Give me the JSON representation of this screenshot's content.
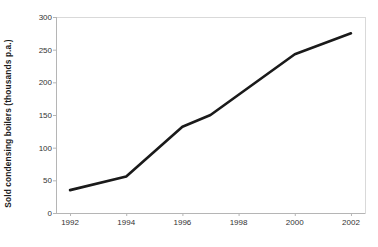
{
  "chart_data": {
    "type": "line",
    "title": "",
    "xlabel": "",
    "ylabel": "Sold condensing boilers (thousands p.a.)",
    "x": [
      1992,
      1994,
      1996,
      1997,
      2000,
      2002
    ],
    "values": [
      35,
      56,
      132,
      150,
      243,
      275
    ],
    "series": [
      {
        "name": "Sold condensing boilers",
        "values": [
          35,
          56,
          132,
          150,
          243,
          275
        ]
      }
    ],
    "xlim": [
      1991.5,
      2002.5
    ],
    "ylim": [
      0,
      300
    ],
    "ytick_labels": [
      "0",
      "50",
      "100",
      "150",
      "200",
      "250",
      "300"
    ],
    "ytick_values": [
      0,
      50,
      100,
      150,
      200,
      250,
      300
    ],
    "xtick_labels": [
      "1992",
      "1994",
      "1996",
      "1998",
      "2000",
      "2002"
    ],
    "xtick_values": [
      1992,
      1994,
      1996,
      1998,
      2000,
      2002
    ],
    "grid": false,
    "legend": false,
    "markers": false,
    "line_color": "#1a1a1a",
    "line_width": 2.6,
    "frame_color": "#d9d9d9",
    "axis_color": "#b5b5b5",
    "background": "#ffffff"
  }
}
